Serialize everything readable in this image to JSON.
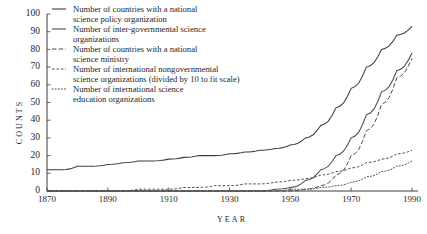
{
  "chart_data": {
    "type": "line",
    "title": "",
    "xlabel": "YEAR",
    "ylabel": "COUNTS",
    "xlim": [
      1870,
      1990
    ],
    "ylim": [
      0,
      100
    ],
    "xticks": [
      1870,
      1890,
      1910,
      1930,
      1950,
      1970,
      1990
    ],
    "yticks": [
      0,
      10,
      20,
      30,
      40,
      50,
      60,
      70,
      80,
      90,
      100
    ],
    "xtick_labels": [
      "1870",
      "1890",
      "1910",
      "1930",
      "1950",
      "1970",
      "1990"
    ],
    "ytick_labels": [
      "0",
      "10",
      "20",
      "30",
      "40",
      "50",
      "60",
      "70",
      "80",
      "90",
      "100"
    ],
    "grid": false,
    "legend_position": "upper-left-inside",
    "x": [
      1870,
      1875,
      1880,
      1885,
      1890,
      1895,
      1900,
      1905,
      1910,
      1915,
      1920,
      1925,
      1930,
      1935,
      1940,
      1945,
      1950,
      1955,
      1960,
      1965,
      1970,
      1975,
      1980,
      1985,
      1990
    ],
    "series": [
      {
        "name": "Number of countries with a national science policy organization",
        "style": "solid",
        "color": "#3d3d3d",
        "values": [
          12,
          12,
          14,
          14,
          15,
          16,
          17,
          17,
          18,
          19,
          20,
          20,
          21,
          22,
          23,
          24,
          26,
          30,
          37,
          47,
          58,
          70,
          80,
          88,
          93
        ]
      },
      {
        "name": "Number of inter-governmental science organizations",
        "style": "solid",
        "color": "#4a4a4a",
        "values": [
          0,
          0,
          0,
          0,
          0,
          0,
          0,
          0,
          0,
          0,
          0,
          0,
          0,
          0,
          0,
          1,
          2,
          6,
          12,
          20,
          30,
          43,
          56,
          68,
          78
        ]
      },
      {
        "name": "Number of countries with a national science ministry",
        "style": "long-dash",
        "color": "#4a4a4a",
        "values": [
          0,
          0,
          0,
          0,
          0,
          0,
          0,
          0,
          0,
          0,
          0,
          0,
          0,
          0,
          0,
          0,
          0,
          1,
          3,
          9,
          20,
          34,
          49,
          64,
          75
        ]
      },
      {
        "name": "Number of international nongovernmental science organizations (divided by 10 to fit scale)",
        "style": "short-dash",
        "color": "#4f4f4f",
        "values": [
          0,
          0,
          0,
          0,
          0,
          0,
          1,
          1,
          1,
          2,
          2,
          3,
          3,
          4,
          4,
          5,
          6,
          7,
          9,
          11,
          13,
          16,
          18,
          21,
          23
        ]
      },
      {
        "name": "Number of international science education organizations",
        "style": "dotted",
        "color": "#535353",
        "values": [
          0,
          0,
          0,
          0,
          0,
          0,
          0,
          0,
          0,
          0,
          0,
          0,
          0,
          0,
          0,
          0,
          1,
          1,
          2,
          3,
          5,
          8,
          11,
          14,
          17
        ]
      }
    ]
  },
  "legend": {
    "entries": [
      {
        "line1": "Number of countries with a national",
        "line2": "science policy organization",
        "style": "solid"
      },
      {
        "line1": "Number of inter-governmental science",
        "line2": "organizations",
        "style": "solid"
      },
      {
        "line1": "Number of countries with a national",
        "line2": "science ministry",
        "style": "long-dash"
      },
      {
        "line1": "Number of international nongovernmental",
        "line2": "science organizations (divided by 10 to fit scale)",
        "style": "short-dash"
      },
      {
        "line1": "Number of international science",
        "line2": "education organizations",
        "style": "dotted"
      }
    ]
  }
}
